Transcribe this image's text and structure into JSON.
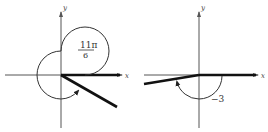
{
  "diagrams": [
    {
      "name": "angle-11pi-over-6",
      "x_axis_label": "x",
      "y_axis_label": "y",
      "angle_numerator": "11π",
      "angle_denominator": "6",
      "angle_radians": "11π/6",
      "direction": "counterclockwise"
    },
    {
      "name": "angle-negative-3",
      "x_axis_label": "x",
      "y_axis_label": "y",
      "angle_label": "−3",
      "angle_radians": "-3",
      "direction": "clockwise"
    }
  ]
}
